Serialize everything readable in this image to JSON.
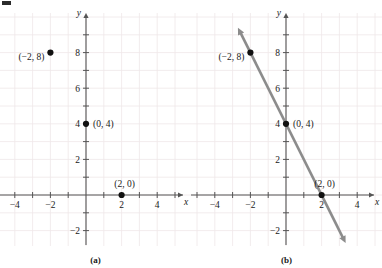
{
  "figure": {
    "corner_mark": "crop-mark",
    "panels": [
      {
        "id": "a",
        "caption": "(a)",
        "has_line": false,
        "axes": {
          "x_label": "x",
          "y_label": "y",
          "x_ticks": [
            -4,
            -2,
            2,
            4
          ],
          "x_tick_labels": [
            "−4",
            "−2",
            "2",
            "4"
          ],
          "y_ticks": [
            -2,
            2,
            4,
            6,
            8
          ],
          "y_tick_labels": [
            "−2",
            "2",
            "4",
            "6",
            "8"
          ],
          "x_range": [
            -5,
            5
          ],
          "y_range": [
            -3,
            9.5
          ],
          "grid": true,
          "grid_step": 1,
          "grid_color": "#efe7e9",
          "axis_color": "#555555"
        },
        "points": [
          {
            "x": -2,
            "y": 8,
            "label": "(−2, 8)",
            "label_pos": "left"
          },
          {
            "x": 0,
            "y": 4,
            "label": "(0, 4)",
            "label_pos": "right"
          },
          {
            "x": 2,
            "y": 0,
            "label": "(2, 0)",
            "label_pos": "above-right"
          }
        ]
      },
      {
        "id": "b",
        "caption": "(b)",
        "has_line": true,
        "axes": {
          "x_label": "x",
          "y_label": "y",
          "x_ticks": [
            -4,
            -2,
            2,
            4
          ],
          "x_tick_labels": [
            "−4",
            "−2",
            "2",
            "4"
          ],
          "y_ticks": [
            -2,
            2,
            4,
            6,
            8
          ],
          "y_tick_labels": [
            "−2",
            "2",
            "4",
            "6",
            "8"
          ],
          "x_range": [
            -5,
            5
          ],
          "y_range": [
            -3,
            9.5
          ],
          "grid": true,
          "grid_step": 1,
          "grid_color": "#efe7e9",
          "axis_color": "#555555"
        },
        "points": [
          {
            "x": -2,
            "y": 8,
            "label": "(−2, 8)",
            "label_pos": "left"
          },
          {
            "x": 0,
            "y": 4,
            "label": "(0, 4)",
            "label_pos": "right"
          },
          {
            "x": 2,
            "y": 0,
            "label": "(2, 0)",
            "label_pos": "above-right"
          }
        ],
        "line": {
          "slope": -2,
          "intercept": 4,
          "from": {
            "x": -2.7,
            "y": 9.4
          },
          "to": {
            "x": 3.35,
            "y": -2.7
          },
          "color": "#8c8c8c",
          "width": 2.6,
          "arrow_start": true,
          "arrow_end": true
        }
      }
    ]
  },
  "chart_data": {
    "type": "scatter",
    "title": "",
    "xlabel": "x",
    "ylabel": "y",
    "xlim": [
      -5,
      5
    ],
    "ylim": [
      -3,
      9.5
    ],
    "grid": true,
    "legend": "none",
    "x": [
      -2,
      0,
      2
    ],
    "y": [
      8,
      4,
      0
    ],
    "point_labels": [
      "(−2, 8)",
      "(0, 4)",
      "(2, 0)"
    ],
    "xticks": [
      -4,
      -2,
      2,
      4
    ],
    "yticks": [
      -2,
      2,
      4,
      6,
      8
    ],
    "series": [
      {
        "name": "plotted points",
        "x": [
          -2,
          0,
          2
        ],
        "y": [
          8,
          4,
          0
        ],
        "type": "scatter"
      },
      {
        "name": "y = -2x + 4",
        "type": "line",
        "slope": -2,
        "intercept": 4,
        "x": [
          -2.7,
          3.35
        ],
        "y": [
          9.4,
          -2.7
        ]
      }
    ],
    "annotations": [
      "(a)",
      "(b)"
    ]
  }
}
